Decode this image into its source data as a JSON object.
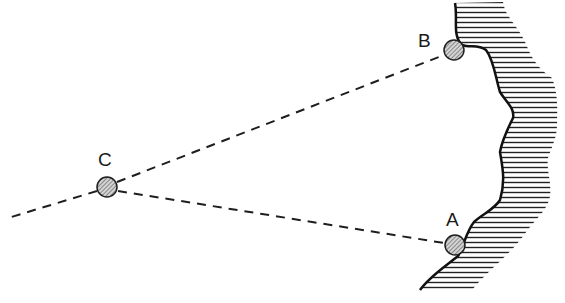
{
  "diagram": {
    "type": "triangulation-sketch",
    "points": [
      {
        "id": "A",
        "label": "A",
        "x": 455,
        "y": 245,
        "label_x": 446,
        "label_y": 226
      },
      {
        "id": "B",
        "label": "B",
        "x": 454,
        "y": 50,
        "label_x": 418,
        "label_y": 47
      },
      {
        "id": "C",
        "label": "C",
        "x": 107,
        "y": 187,
        "label_x": 98,
        "label_y": 166
      }
    ],
    "lines": [
      {
        "from": "C",
        "to": "B",
        "style": "dashed"
      },
      {
        "from": "C",
        "to": "A",
        "style": "dashed"
      },
      {
        "from": "C",
        "to": "off-left",
        "style": "dashed",
        "end_x": 8,
        "end_y": 218
      }
    ],
    "land": {
      "hatch": "horizontal",
      "side": "right"
    },
    "colors": {
      "ink": "#1e1e1e",
      "station_fill": "#b8b8b8",
      "background": "#ffffff"
    }
  }
}
